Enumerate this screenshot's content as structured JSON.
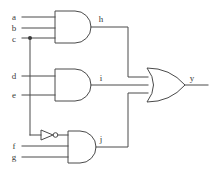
{
  "diagram": {
    "background_color": "#ffffff",
    "line_color": "#4a4a4a",
    "label_color": "#3a3a3a"
  },
  "inputs": [
    {
      "id": "a",
      "label": "a",
      "x": 14,
      "y": 17,
      "wire_y": 17
    },
    {
      "id": "b",
      "label": "b",
      "x": 14,
      "y": 28,
      "wire_y": 28
    },
    {
      "id": "c",
      "label": "c",
      "x": 14,
      "y": 39,
      "wire_y": 38
    },
    {
      "id": "d",
      "label": "d",
      "x": 14,
      "y": 76,
      "wire_y": 76
    },
    {
      "id": "e",
      "label": "e",
      "x": 14,
      "y": 95,
      "wire_y": 95
    },
    {
      "id": "f",
      "label": "f",
      "x": 14,
      "y": 146,
      "wire_y": 146
    },
    {
      "id": "g",
      "label": "g",
      "x": 14,
      "y": 158,
      "wire_y": 157
    }
  ],
  "gates": [
    {
      "id": "and-top",
      "type": "AND",
      "inputs": [
        "a",
        "b",
        "c"
      ],
      "output": "h"
    },
    {
      "id": "and-middle",
      "type": "AND",
      "inputs": [
        "d",
        "e"
      ],
      "output": "i"
    },
    {
      "id": "inverter-c",
      "type": "NOT",
      "inputs": [
        "c"
      ],
      "output": "c-not"
    },
    {
      "id": "and-bottom",
      "type": "AND",
      "inputs": [
        "c-not",
        "f",
        "g"
      ],
      "output": "j"
    },
    {
      "id": "or-output",
      "type": "OR",
      "inputs": [
        "h",
        "i",
        "j"
      ],
      "output": "y"
    }
  ],
  "intermediate_labels": [
    {
      "id": "h",
      "label": "h",
      "x": 101,
      "y": 22
    },
    {
      "id": "i",
      "label": "i",
      "x": 101,
      "y": 80
    },
    {
      "id": "j",
      "label": "j",
      "x": 101,
      "y": 139
    }
  ],
  "output": {
    "id": "y",
    "label": "y",
    "x": 192,
    "y": 80
  },
  "junctions": [
    {
      "id": "c-branch",
      "x": 30,
      "y": 38,
      "r": 2
    }
  ]
}
